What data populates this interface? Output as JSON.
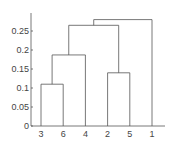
{
  "chart_data": {
    "type": "dendrogram",
    "title": "",
    "xlabel": "",
    "ylabel": "",
    "ylim": [
      0,
      0.3
    ],
    "yticks": [
      0,
      0.05,
      0.1,
      0.15,
      0.2,
      0.25
    ],
    "ytick_labels": [
      "0",
      "0.05",
      "0.1",
      "0.15",
      "0.2",
      "0.25"
    ],
    "leaf_order": [
      "3",
      "6",
      "4",
      "2",
      "5",
      "1"
    ],
    "merges": [
      {
        "left": "3",
        "right": "6",
        "height": 0.11
      },
      {
        "left": "(3,6)",
        "right": "4",
        "height": 0.187
      },
      {
        "left": "2",
        "right": "5",
        "height": 0.14
      },
      {
        "left": "((3,6),4)",
        "right": "(2,5)",
        "height": 0.265
      },
      {
        "left": "(((3,6),4),(2,5))",
        "right": "1",
        "height": 0.28
      }
    ],
    "grid": false,
    "line_color": "#555555"
  }
}
